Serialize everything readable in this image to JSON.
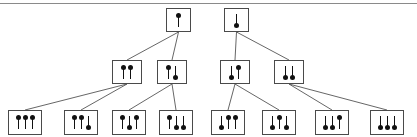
{
  "diagram": {
    "stroke_color": "#4a4a4a",
    "edge_color": "#555555",
    "glyph_color": "#111111",
    "background": "#ffffff",
    "rule_color": "#8a8a8a",
    "glyphs": {
      "up": "up-arrow",
      "down": "down-arrow"
    },
    "nodes": [
      {
        "id": "L0",
        "spins": [
          "up"
        ],
        "x": 166,
        "y": 8,
        "w": 25,
        "h": 24,
        "level": 0,
        "tree": "left"
      },
      {
        "id": "R0",
        "spins": [
          "down"
        ],
        "x": 224,
        "y": 8,
        "w": 25,
        "h": 24,
        "level": 0,
        "tree": "right"
      },
      {
        "id": "L1a",
        "spins": [
          "up",
          "up"
        ],
        "x": 112,
        "y": 60,
        "w": 30,
        "h": 24,
        "level": 1,
        "tree": "left"
      },
      {
        "id": "L1b",
        "spins": [
          "up",
          "down"
        ],
        "x": 157,
        "y": 60,
        "w": 30,
        "h": 24,
        "level": 1,
        "tree": "left"
      },
      {
        "id": "R1a",
        "spins": [
          "down",
          "up"
        ],
        "x": 220,
        "y": 60,
        "w": 30,
        "h": 24,
        "level": 1,
        "tree": "right"
      },
      {
        "id": "R1b",
        "spins": [
          "down",
          "down"
        ],
        "x": 274,
        "y": 60,
        "w": 30,
        "h": 24,
        "level": 1,
        "tree": "right"
      },
      {
        "id": "L2a",
        "spins": [
          "up",
          "up",
          "up"
        ],
        "x": 8,
        "y": 110,
        "w": 34,
        "h": 25,
        "level": 2,
        "tree": "left"
      },
      {
        "id": "L2b",
        "spins": [
          "up",
          "up",
          "down"
        ],
        "x": 64,
        "y": 110,
        "w": 34,
        "h": 25,
        "level": 2,
        "tree": "left"
      },
      {
        "id": "L2c",
        "spins": [
          "up",
          "down",
          "up"
        ],
        "x": 112,
        "y": 110,
        "w": 34,
        "h": 25,
        "level": 2,
        "tree": "left"
      },
      {
        "id": "L2d",
        "spins": [
          "up",
          "down",
          "down"
        ],
        "x": 159,
        "y": 110,
        "w": 34,
        "h": 25,
        "level": 2,
        "tree": "left"
      },
      {
        "id": "R2a",
        "spins": [
          "down",
          "up",
          "up"
        ],
        "x": 211,
        "y": 110,
        "w": 34,
        "h": 25,
        "level": 2,
        "tree": "right"
      },
      {
        "id": "R2b",
        "spins": [
          "down",
          "up",
          "down"
        ],
        "x": 262,
        "y": 110,
        "w": 34,
        "h": 25,
        "level": 2,
        "tree": "right"
      },
      {
        "id": "R2c",
        "spins": [
          "down",
          "down",
          "up"
        ],
        "x": 315,
        "y": 110,
        "w": 34,
        "h": 25,
        "level": 2,
        "tree": "right"
      },
      {
        "id": "R2d",
        "spins": [
          "down",
          "down",
          "down"
        ],
        "x": 370,
        "y": 110,
        "w": 34,
        "h": 25,
        "level": 2,
        "tree": "right"
      }
    ],
    "edges": [
      {
        "from": "L0",
        "to": "L1a"
      },
      {
        "from": "L0",
        "to": "L1b"
      },
      {
        "from": "R0",
        "to": "R1a"
      },
      {
        "from": "R0",
        "to": "R1b"
      },
      {
        "from": "L1a",
        "to": "L2a"
      },
      {
        "from": "L1a",
        "to": "L2b"
      },
      {
        "from": "L1b",
        "to": "L2c"
      },
      {
        "from": "L1b",
        "to": "L2d"
      },
      {
        "from": "R1a",
        "to": "R2a"
      },
      {
        "from": "R1a",
        "to": "R2b"
      },
      {
        "from": "R1b",
        "to": "R2c"
      },
      {
        "from": "R1b",
        "to": "R2d"
      }
    ]
  }
}
